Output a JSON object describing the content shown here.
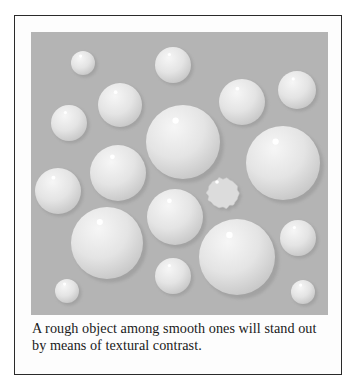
{
  "figure": {
    "caption": "A rough object among smooth ones will stand out by means of textural contrast.",
    "colors": {
      "frame_border": "#2a2a2a",
      "panel_background": "#b4b4b4",
      "bubble_light": "#f4f4f4",
      "bubble_dark": "#c8c8c8",
      "shadow": "#9c9c9c",
      "highlight": "#ffffff"
    },
    "smooth_objects": [
      {
        "cx": 83,
        "cy": 63,
        "r": 12
      },
      {
        "cx": 173,
        "cy": 65,
        "r": 18
      },
      {
        "cx": 120,
        "cy": 105,
        "r": 22
      },
      {
        "cx": 242,
        "cy": 102,
        "r": 23
      },
      {
        "cx": 297,
        "cy": 90,
        "r": 19
      },
      {
        "cx": 69,
        "cy": 123,
        "r": 18
      },
      {
        "cx": 183,
        "cy": 142,
        "r": 37
      },
      {
        "cx": 283,
        "cy": 163,
        "r": 37
      },
      {
        "cx": 118,
        "cy": 173,
        "r": 28
      },
      {
        "cx": 58,
        "cy": 191,
        "r": 23
      },
      {
        "cx": 175,
        "cy": 217,
        "r": 28
      },
      {
        "cx": 107,
        "cy": 243,
        "r": 36
      },
      {
        "cx": 237,
        "cy": 257,
        "r": 38
      },
      {
        "cx": 298,
        "cy": 238,
        "r": 18
      },
      {
        "cx": 173,
        "cy": 276,
        "r": 18
      },
      {
        "cx": 67,
        "cy": 291,
        "r": 12
      },
      {
        "cx": 303,
        "cy": 292,
        "r": 12
      }
    ],
    "rough_object": {
      "cx": 223,
      "cy": 193,
      "w": 34,
      "h": 32
    }
  }
}
